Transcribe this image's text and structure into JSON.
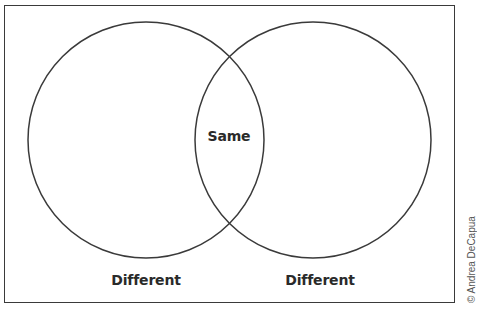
{
  "diagram": {
    "type": "venn",
    "sets": [
      {
        "name": "left-circle",
        "label": "Different"
      },
      {
        "name": "right-circle",
        "label": "Different"
      }
    ],
    "intersection_label": "Same",
    "left_label": "Different",
    "right_label": "Different"
  },
  "credit": {
    "text": "© Andrea DeCapua"
  },
  "colors": {
    "stroke": "#3a3a3a",
    "text": "#2a2a2a",
    "background": "#ffffff"
  }
}
